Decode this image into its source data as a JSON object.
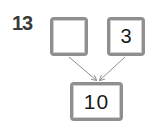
{
  "problem": {
    "number": "13",
    "top_left_value": "",
    "top_right_value": "3",
    "bottom_value": "10"
  },
  "colors": {
    "box_border": "#8f8f8f",
    "arrow": "#8f8f8f",
    "text": "#1a1a1a",
    "number": "#3a3a3a"
  }
}
